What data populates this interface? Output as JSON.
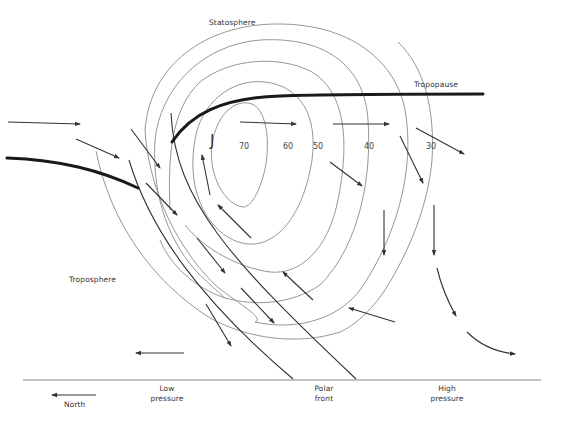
{
  "diagram": {
    "labels": {
      "stratosphere": "Statosphere",
      "tropopause": "Tropopause",
      "troposphere": "Troposphere",
      "jet": "J",
      "low_pressure": "Low\npressure",
      "polar_front": "Polar\nfront",
      "high_pressure": "High\npressure",
      "north": "North"
    },
    "isotachs": [
      {
        "value": "70"
      },
      {
        "value": "60"
      },
      {
        "value": "50"
      },
      {
        "value": "40"
      },
      {
        "value": "30"
      }
    ],
    "colors": {
      "line": "#333333",
      "contour": "#8a8a8a",
      "background": "#ffffff"
    }
  }
}
